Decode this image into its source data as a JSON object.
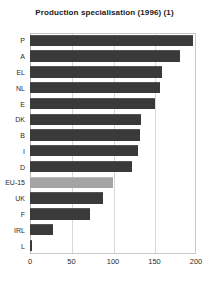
{
  "chart_data": {
    "type": "bar",
    "orientation": "horizontal",
    "title": "Production specialisation (1996) (1)",
    "xlabel": "",
    "ylabel": "",
    "xlim": [
      0,
      200
    ],
    "xticks": [
      0,
      50,
      100,
      150,
      200
    ],
    "grid": true,
    "legend": null,
    "categories": [
      "P",
      "A",
      "EL",
      "NL",
      "E",
      "DK",
      "B",
      "I",
      "D",
      "EU-15",
      "UK",
      "F",
      "IRL",
      "L"
    ],
    "values": [
      196,
      181,
      159,
      157,
      150,
      134,
      132,
      130,
      123,
      100,
      88,
      72,
      28,
      2
    ],
    "highlight_category": "EU-15",
    "colors": {
      "bar": "#3a3a3a",
      "bar_highlight": "#a4a4a4",
      "grid": "#d8d8d8",
      "axis": "#c9c9c9",
      "text": "#2a2a2a",
      "title": "#1a1a1a",
      "background": "#ffffff"
    }
  }
}
